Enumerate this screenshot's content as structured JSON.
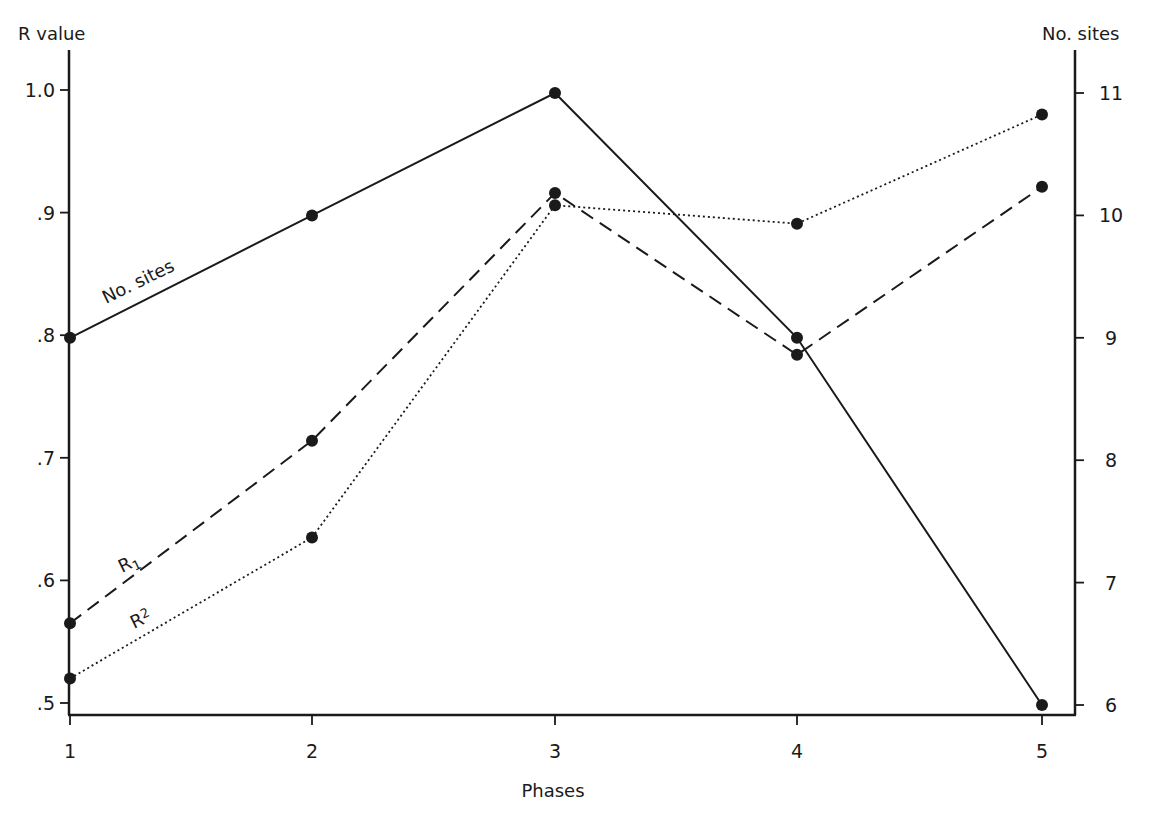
{
  "chart_data": {
    "type": "line",
    "title": "",
    "xlabel": "Phases",
    "ylabel": "R value",
    "ylabel_right": "No. sites",
    "categories": [
      1,
      2,
      3,
      4,
      5
    ],
    "x_tick_labels": [
      "1",
      "2",
      "3",
      "4",
      "5"
    ],
    "ylim": [
      0.5,
      1.0
    ],
    "y_ticks": [
      0.5,
      0.6,
      0.7,
      0.8,
      0.9,
      1.0
    ],
    "y_tick_labels": [
      ".5",
      ".6",
      ".7",
      ".8",
      ".9",
      "1.0"
    ],
    "ylim_right": [
      6,
      11
    ],
    "y_ticks_right": [
      6,
      7,
      8,
      9,
      10,
      11
    ],
    "y_tick_labels_right": [
      "6",
      "7",
      "8",
      "9",
      "10",
      "11"
    ],
    "grid": false,
    "legend": "inline labels on lines",
    "series": [
      {
        "name": "No. sites",
        "axis": "right",
        "style": "solid",
        "values": [
          9,
          10,
          11,
          9,
          6
        ]
      },
      {
        "name": "R1",
        "axis": "left",
        "style": "dashed",
        "values": [
          0.565,
          0.714,
          0.916,
          0.784,
          0.921
        ]
      },
      {
        "name": "R2",
        "axis": "left",
        "style": "dotted",
        "values": [
          0.52,
          0.635,
          0.906,
          0.891,
          0.98
        ]
      }
    ]
  },
  "labels": {
    "ylabel_left": "R value",
    "ylabel_right": "No. sites",
    "xlabel": "Phases",
    "series_sites": "No. sites",
    "series_r1_main": "R",
    "series_r1_sub": "1",
    "series_r2_main": "R",
    "series_r2_sub": "2"
  }
}
